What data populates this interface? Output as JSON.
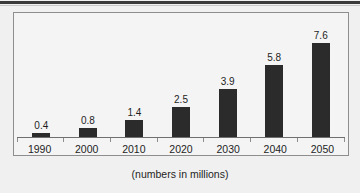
{
  "chart_data": {
    "type": "bar",
    "title": "",
    "subtitle": "",
    "caption": "(numbers in millions)",
    "xlabel": "",
    "ylabel": "",
    "categories": [
      "1990",
      "2000",
      "2010",
      "2020",
      "2030",
      "2040",
      "2050"
    ],
    "values": [
      0.4,
      0.8,
      1.4,
      2.5,
      3.9,
      5.8,
      7.6
    ],
    "value_labels": [
      "0.4",
      "0.8",
      "1.4",
      "2.5",
      "3.9",
      "5.8",
      "7.6"
    ],
    "series": [
      {
        "name": "",
        "values": [
          0.4,
          0.8,
          1.4,
          2.5,
          3.9,
          5.8,
          7.6
        ]
      }
    ],
    "ylim": [
      0,
      8.6
    ],
    "grid": false,
    "legend": "none",
    "axis_ticks_visible": true,
    "bar_color": "#2b2b2b",
    "plot_background": "#f4f4f4",
    "frame_color": "#8e8e8e"
  },
  "page": {
    "background": "#f0f0f0",
    "top_rule_color": "#3a3a3a"
  }
}
